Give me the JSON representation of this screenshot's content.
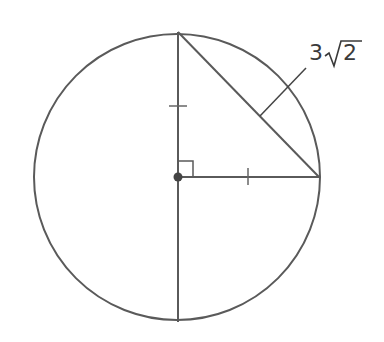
{
  "diagram": {
    "circle": {
      "cx": 177,
      "cy": 177,
      "r": 143
    },
    "center_point": {
      "x": 178,
      "y": 177
    },
    "chord_label": {
      "coefficient": "3",
      "radical_symbol": "√",
      "radicand": "2",
      "text": "3√2"
    },
    "marks": {
      "right_angle": "right angle at center between vertical radius and horizontal radius",
      "congruent_ticks": "single tick marks on upper vertical radius and horizontal radius"
    },
    "stroke_color": "#555555",
    "point_color": "#444444"
  }
}
